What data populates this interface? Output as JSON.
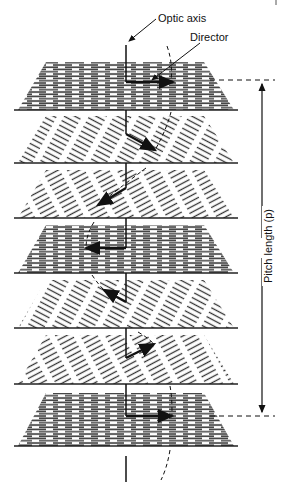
{
  "diagram": {
    "labels": {
      "optic_axis": "Optic axis",
      "director": "Director",
      "pitch_length": "Pitch length (p)"
    },
    "colors": {
      "ink": "#111111",
      "background": "#ffffff"
    },
    "layers": [
      {
        "index": 1,
        "top": 62,
        "bottom": 110,
        "molecule_angle_deg": 0,
        "arrow": "right"
      },
      {
        "index": 2,
        "top": 116,
        "bottom": 163,
        "molecule_angle_deg": 30,
        "arrow": "down-right"
      },
      {
        "index": 3,
        "top": 170,
        "bottom": 218,
        "molecule_angle_deg": -30,
        "arrow": "down-left"
      },
      {
        "index": 4,
        "top": 225,
        "bottom": 273,
        "molecule_angle_deg": 0,
        "arrow": "left"
      },
      {
        "index": 5,
        "top": 280,
        "bottom": 328,
        "molecule_angle_deg": 30,
        "arrow": "up-left"
      },
      {
        "index": 6,
        "top": 335,
        "bottom": 384,
        "molecule_angle_deg": -30,
        "arrow": "up-right"
      },
      {
        "index": 7,
        "top": 393,
        "bottom": 446,
        "molecule_angle_deg": 0,
        "arrow": "right"
      }
    ],
    "pitch": {
      "top_y": 80,
      "bottom_y": 416,
      "x": 262
    }
  }
}
